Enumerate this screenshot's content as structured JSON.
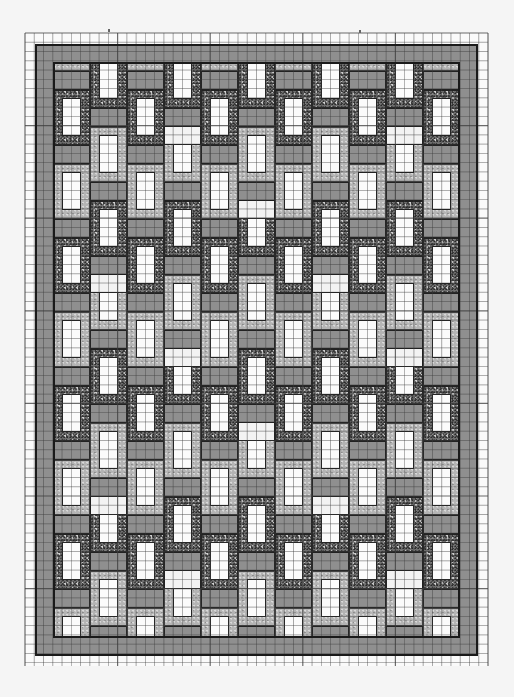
{
  "document": {
    "type": "quilt-design-sketch-on-graph-paper",
    "description": "Hand-drawn woven lattice quilt pattern with speckled frames, grey bars and white windows"
  },
  "graph_paper": {
    "left": 25,
    "top": 33,
    "right": 488,
    "bottom": 666,
    "cell_size": 9.26,
    "line_color": "#3c3c3c",
    "major_every": 10
  },
  "quilt": {
    "outer_border": {
      "left": 35,
      "top": 44,
      "right": 478,
      "bottom": 656,
      "color": "#8a8a8a"
    },
    "inner_field": {
      "left": 53,
      "top": 62,
      "right": 460,
      "bottom": 638
    },
    "columns": 11,
    "column_width": 37,
    "period": 74,
    "colors": {
      "bar": "#8f8f8f",
      "frame_dark": "#6e6e6e",
      "frame_light": "#b4b4b4",
      "window": "#fbfbfb",
      "outline": "#1a1a1a"
    }
  },
  "marks": [
    {
      "x": 108,
      "y": 29
    },
    {
      "x": 359,
      "y": 30
    }
  ]
}
